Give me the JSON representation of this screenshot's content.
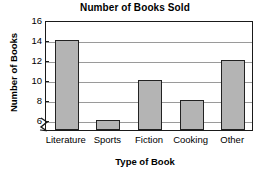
{
  "chart_data": {
    "type": "bar",
    "title": "Number of Books Sold",
    "xlabel": "Type of Book",
    "ylabel": "Number of Books",
    "categories": [
      "Literature",
      "Sports",
      "Fiction",
      "Cooking",
      "Other"
    ],
    "values": [
      14,
      6,
      10,
      8,
      12
    ],
    "ylim": [
      5,
      16
    ],
    "y_ticks": [
      6,
      8,
      10,
      12,
      14,
      16
    ],
    "y_axis_break": true,
    "grid": true,
    "legend": "none",
    "bar_color": "#b4b4b4",
    "bar_border_color": "#222222",
    "frame_color": "#1a1a1a",
    "gridline_color": "#9a9a9a",
    "background_color": "#ffffff",
    "text_color": "#000000"
  }
}
